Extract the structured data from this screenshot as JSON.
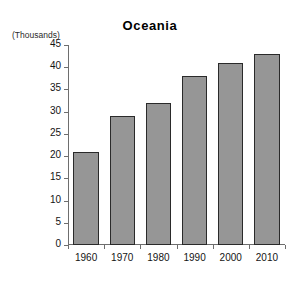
{
  "chart_data": {
    "type": "bar",
    "title": "Oceania",
    "unit_caption": "(Thousands)",
    "xlabel": "",
    "ylabel": "",
    "categories": [
      "1960",
      "1970",
      "1980",
      "1990",
      "2000",
      "2010"
    ],
    "values": [
      21,
      29,
      32,
      38,
      41,
      43
    ],
    "ylim": [
      0,
      45
    ],
    "ytick_step": 5,
    "yticks": [
      0,
      5,
      10,
      15,
      20,
      25,
      30,
      35,
      40,
      45
    ],
    "ytick_labels": [
      "0",
      "5",
      "10",
      "15",
      "20",
      "25",
      "30",
      "35",
      "40",
      "45"
    ],
    "grid": false,
    "legend": null,
    "legend_position": "none",
    "series": [
      {
        "name": "Oceania",
        "values": [
          21,
          29,
          32,
          38,
          41,
          43
        ]
      }
    ],
    "colors": {
      "bar_fill": "#969696",
      "bar_border": "#2a2a2a",
      "axis": "#6e6e6e",
      "text": "#141414",
      "background": "#ffffff"
    }
  }
}
